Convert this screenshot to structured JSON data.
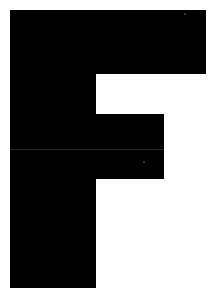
{
  "glyph": {
    "character": "F",
    "color": "#000000",
    "background": "#ffffff",
    "parts": {
      "stem": {
        "left": 10,
        "top": 10,
        "width": 86,
        "height": 278
      },
      "top_bar": {
        "left": 10,
        "top": 10,
        "width": 196,
        "height": 64
      },
      "middle_bar": {
        "left": 10,
        "top": 114,
        "width": 154,
        "height": 65
      }
    },
    "seam": {
      "left": 10,
      "top": 149,
      "width": 154
    }
  }
}
